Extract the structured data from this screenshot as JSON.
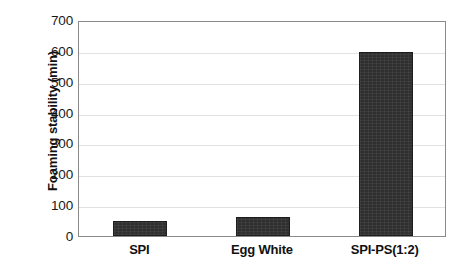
{
  "chart_data": {
    "type": "bar",
    "title": "",
    "xlabel": "",
    "ylabel": "Foaming stability (min)",
    "categories": [
      "SPI",
      "Egg White",
      "SPI-PS(1:2)"
    ],
    "values": [
      50,
      62,
      597
    ],
    "ylim": [
      0,
      700
    ],
    "yticks": [
      0,
      100,
      200,
      300,
      400,
      500,
      600,
      700
    ],
    "ytick_labels": [
      "0",
      "100",
      "200",
      "300",
      "400",
      "500",
      "600",
      "700"
    ],
    "grid": true,
    "grid_axis": "y",
    "legend": false,
    "legend_position": "none",
    "series": [
      {
        "name": "Foaming stability",
        "values": [
          50,
          62,
          597
        ],
        "color": "#2f2f2f"
      }
    ],
    "bar_color": "#2f2f2f",
    "frame_color": "#8a8a8a",
    "gridline_color": "#e2e2e2",
    "background": "#ffffff"
  },
  "axes": {
    "y_title": "Foaming stability (min)",
    "y_ticks": [
      {
        "label": "700",
        "value": 700
      },
      {
        "label": "600",
        "value": 600
      },
      {
        "label": "500",
        "value": 500
      },
      {
        "label": "400",
        "value": 400
      },
      {
        "label": "300",
        "value": 300
      },
      {
        "label": "200",
        "value": 200
      },
      {
        "label": "100",
        "value": 100
      },
      {
        "label": "0",
        "value": 0
      }
    ],
    "x_ticks": [
      {
        "label": "SPI"
      },
      {
        "label": "Egg White"
      },
      {
        "label": "SPI-PS(1:2)"
      }
    ]
  }
}
